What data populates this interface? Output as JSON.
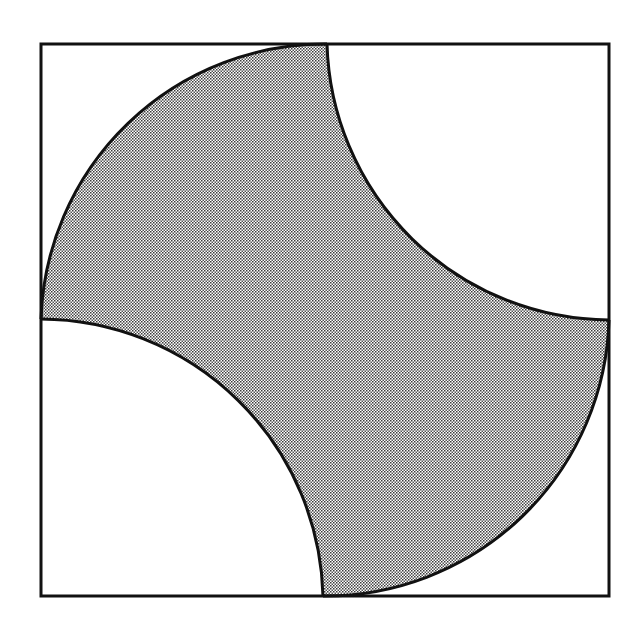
{
  "diagram": {
    "title": "",
    "canvas": {
      "width": 640,
      "height": 623
    },
    "square": {
      "x1": 41,
      "y1": 44,
      "x2": 609,
      "y2": 596
    },
    "center": {
      "x": 325,
      "y": 320
    },
    "radius": 284,
    "shaded_region": {
      "pattern": "dotted-halftone",
      "fill_color": "#a9a9a9",
      "dot_color": "#3a3a3a",
      "background_color": "#ffffff"
    },
    "cutouts": [
      {
        "name": "top-right-quarter-circle",
        "center_x": 609,
        "center_y": 44,
        "radius": 284
      },
      {
        "name": "bottom-left-quarter-circle",
        "center_x": 41,
        "center_y": 596,
        "radius": 284
      }
    ],
    "arc_meeting_points": {
      "top": {
        "x": 327,
        "y": 44
      },
      "left": {
        "x": 41,
        "y": 319
      },
      "right": {
        "x": 609,
        "y": 320
      },
      "bottom": {
        "x": 323,
        "y": 596
      }
    },
    "stroke_color": "#111111",
    "stroke_width": 3
  }
}
